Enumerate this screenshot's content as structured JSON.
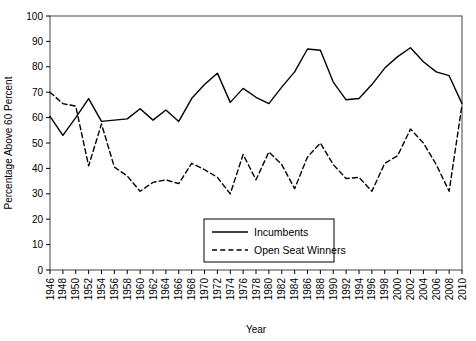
{
  "chart_data": {
    "type": "line",
    "title": "",
    "xlabel": "Year",
    "ylabel": "Percentage Above 60 Percent",
    "xlim": [
      1946,
      2010
    ],
    "ylim": [
      0,
      100
    ],
    "grid": false,
    "legend_position": "lower-center",
    "x": [
      1946,
      1948,
      1950,
      1952,
      1954,
      1956,
      1958,
      1960,
      1962,
      1964,
      1966,
      1968,
      1970,
      1972,
      1974,
      1976,
      1978,
      1980,
      1982,
      1984,
      1986,
      1988,
      1990,
      1992,
      1994,
      1996,
      1998,
      2000,
      2002,
      2004,
      2006,
      2008,
      2010
    ],
    "xticks": [
      "1946",
      "1948",
      "1950",
      "1952",
      "1954",
      "1956",
      "1958",
      "1960",
      "1962",
      "1964",
      "1966",
      "1968",
      "1970",
      "1972",
      "1974",
      "1976",
      "1978",
      "1980",
      "1982",
      "1984",
      "1986",
      "1988",
      "1990",
      "1992",
      "1994",
      "1996",
      "1998",
      "2000",
      "2002",
      "2004",
      "2006",
      "2008",
      "2010"
    ],
    "yticks": [
      "0",
      "10",
      "20",
      "30",
      "40",
      "50",
      "60",
      "70",
      "80",
      "90",
      "100"
    ],
    "series": [
      {
        "name": "Incumbents",
        "style": "solid",
        "color": "#000000",
        "values": [
          60.5,
          53.0,
          60.0,
          67.5,
          58.5,
          59.0,
          59.5,
          63.5,
          59.0,
          63.0,
          58.5,
          67.5,
          73.0,
          77.5,
          66.0,
          71.5,
          68.0,
          65.5,
          72.0,
          78.0,
          87.0,
          86.5,
          74.0,
          67.0,
          67.5,
          73.0,
          79.5,
          84.0,
          87.5,
          82.0,
          78.0,
          76.5,
          65.5
        ]
      },
      {
        "name": "Open Seat Winners",
        "style": "dashed",
        "color": "#000000",
        "values": [
          70.0,
          65.5,
          64.5,
          41.0,
          57.5,
          40.5,
          37.0,
          31.0,
          34.5,
          35.5,
          34.0,
          42.0,
          39.5,
          36.5,
          30.0,
          45.5,
          35.5,
          46.5,
          41.5,
          32.0,
          44.5,
          50.0,
          41.5,
          36.0,
          36.5,
          31.0,
          42.0,
          45.0,
          55.5,
          50.0,
          41.5,
          31.0,
          65.0
        ]
      }
    ]
  },
  "legend": {
    "items": [
      {
        "label": "Incumbents",
        "style": "solid"
      },
      {
        "label": "Open Seat Winners",
        "style": "dashed"
      }
    ]
  },
  "axes": {
    "x_title": "Year",
    "y_title": "Percentage Above 60 Percent"
  }
}
